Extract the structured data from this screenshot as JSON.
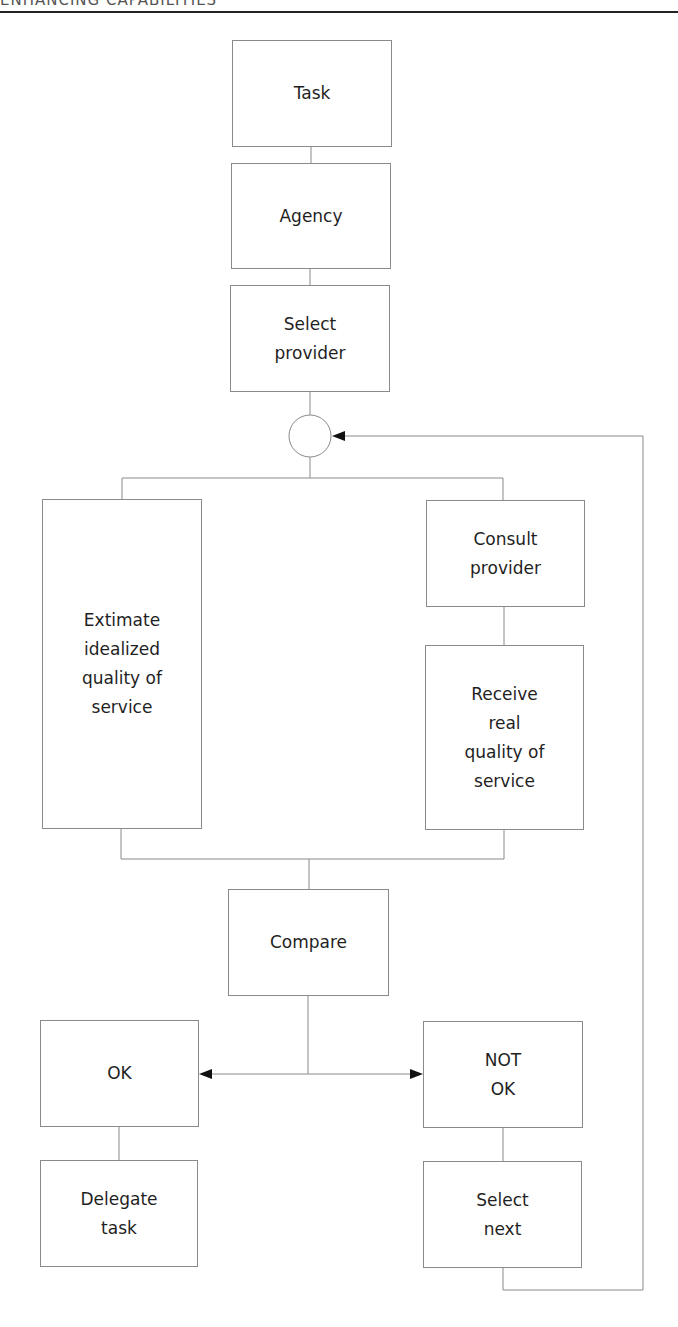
{
  "header": {
    "running_title": "ENHANCING CAPABILITIES"
  },
  "diagram": {
    "type": "flowchart",
    "nodes": {
      "task": "Task",
      "agency": "Agency",
      "select_provider": "Select\nprovider",
      "estimate": "Extimate\nidealized\nquality of\nservice",
      "consult_provider": "Consult\nprovider",
      "receive_real": "Receive\nreal\nquality of\nservice",
      "compare": "Compare",
      "ok": "OK",
      "not_ok": "NOT\nOK",
      "delegate_task": "Delegate\ntask",
      "select_next": "Select\nnext"
    },
    "edges": [
      [
        "task",
        "agency"
      ],
      [
        "agency",
        "select_provider"
      ],
      [
        "select_provider",
        "junction"
      ],
      [
        "junction",
        "estimate"
      ],
      [
        "junction",
        "consult_provider"
      ],
      [
        "consult_provider",
        "receive_real"
      ],
      [
        "estimate",
        "compare"
      ],
      [
        "receive_real",
        "compare"
      ],
      [
        "compare",
        "ok"
      ],
      [
        "compare",
        "not_ok"
      ],
      [
        "ok",
        "delegate_task"
      ],
      [
        "not_ok",
        "select_next"
      ],
      [
        "select_next",
        "junction"
      ]
    ],
    "colors": {
      "line": "#8a8a8a",
      "arrow": "#111111",
      "text": "#1f1f1f"
    }
  }
}
